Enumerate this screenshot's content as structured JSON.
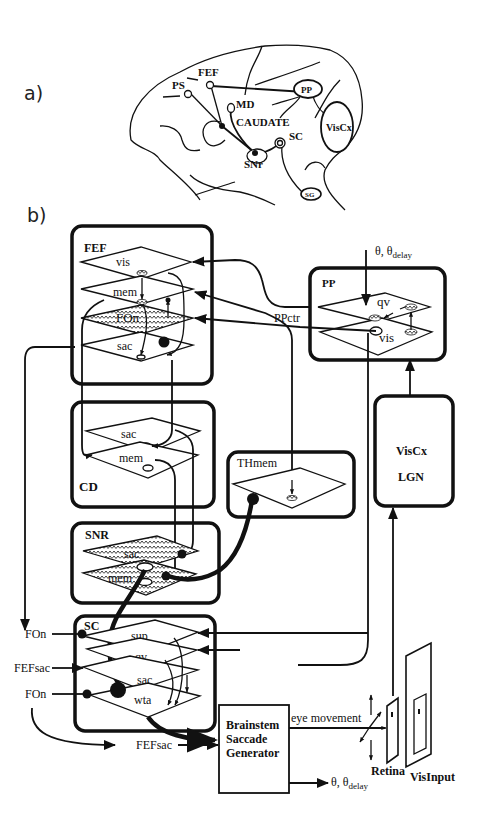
{
  "panels": {
    "a": {
      "label": "a)",
      "regions": [
        "PS",
        "FEF",
        "MD",
        "CAUDATE",
        "PP",
        "VisCx",
        "SC",
        "SNr",
        "SG"
      ]
    },
    "b": {
      "label": "b)",
      "modules": {
        "fef": {
          "title": "FEF",
          "layers": [
            "vis",
            "mem",
            "FOn",
            "sac"
          ]
        },
        "pp": {
          "title": "PP",
          "layers": [
            "qv",
            "vis"
          ]
        },
        "cd": {
          "title": "CD",
          "layers": [
            "sac",
            "mem"
          ]
        },
        "thmem": {
          "title": "THmem"
        },
        "viscx": {
          "title": "VisCx",
          "subtitle": "LGN"
        },
        "snr": {
          "title": "SNR",
          "layers": [
            "sac",
            "mem"
          ]
        },
        "sc": {
          "title": "SC",
          "layers": [
            "sup",
            "qv",
            "sac",
            "wta"
          ]
        },
        "brainstem": {
          "line1": "Brainstem",
          "line2": "Saccade",
          "line3": "Generator"
        }
      },
      "labels": {
        "theta_top": "θ, θ",
        "theta_top_sub": "delay",
        "pp_ctr": "PPctr",
        "fon_in_1": "FOn",
        "fefsac_in": "FEFsac",
        "fon_in_2": "FOn",
        "fefsac_bottom": "FEFsac",
        "eye_movement": "eye movement",
        "theta_out": "θ, θ",
        "theta_out_sub": "delay",
        "retina": "Retina",
        "visinput": "VisInput"
      }
    }
  }
}
